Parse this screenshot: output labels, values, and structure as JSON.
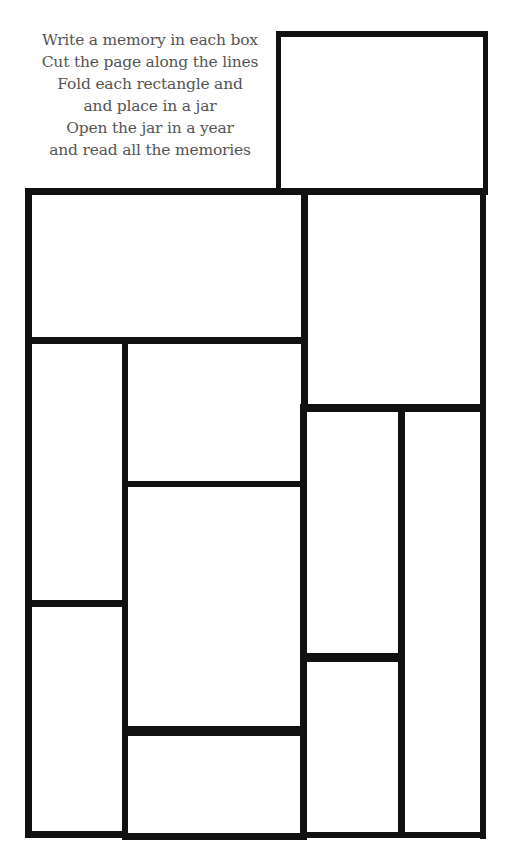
{
  "instructions": {
    "lines": [
      "Write a memory in each box",
      "Cut the page along the lines",
      "Fold each rectangle and",
      "and place in a jar",
      "Open the jar in a year",
      "and read all the memories"
    ]
  },
  "colors": {
    "text": "#555555",
    "lines": "#111111",
    "background": "#ffffff"
  },
  "boxes": [
    {
      "id": "top-right",
      "content": ""
    },
    {
      "id": "top-left-wide",
      "content": ""
    },
    {
      "id": "right-upper",
      "content": ""
    },
    {
      "id": "left-column-upper",
      "content": ""
    },
    {
      "id": "middle-upper",
      "content": ""
    },
    {
      "id": "middle-center",
      "content": ""
    },
    {
      "id": "middle-bottom",
      "content": ""
    },
    {
      "id": "left-column-lower",
      "content": ""
    },
    {
      "id": "right-inner-upper",
      "content": ""
    },
    {
      "id": "right-inner-lower",
      "content": ""
    },
    {
      "id": "right-outer-tall",
      "content": ""
    }
  ]
}
